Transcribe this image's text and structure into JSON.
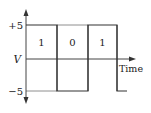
{
  "diagram": {
    "type": "digital-signal-waveform",
    "y_axis": {
      "label": "V",
      "ticks": [
        "+5",
        "−5"
      ]
    },
    "x_axis": {
      "label": "Time"
    },
    "bits": [
      "1",
      "0",
      "1"
    ],
    "levels": {
      "high": "+5",
      "low": "−5"
    },
    "colors": {
      "line": "#444444",
      "text": "#222222",
      "background": "#ffffff"
    }
  }
}
